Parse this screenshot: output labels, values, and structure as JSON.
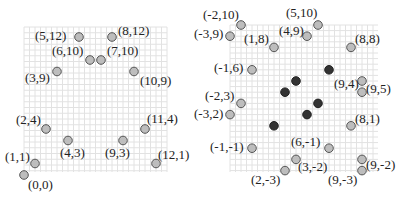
{
  "chart_data": [
    {
      "type": "scatter",
      "title": "",
      "grid": true,
      "xlim": [
        0,
        12
      ],
      "ylim": [
        0,
        12
      ],
      "series": [
        {
          "name": "labeled-points",
          "style": "light",
          "points": [
            {
              "x": 5,
              "y": 12,
              "label": "(5,12)",
              "lx": -44,
              "ly": 3
            },
            {
              "x": 8,
              "y": 12,
              "label": "(8,12)",
              "lx": 6,
              "ly": -2
            },
            {
              "x": 6,
              "y": 10,
              "label": "(6,10)",
              "lx": -38,
              "ly": -5
            },
            {
              "x": 7,
              "y": 10,
              "label": "(7,10)",
              "lx": 6,
              "ly": -5
            },
            {
              "x": 3,
              "y": 9,
              "label": "(3,9)",
              "lx": -32,
              "ly": 10
            },
            {
              "x": 10,
              "y": 9,
              "label": "(10,9)",
              "lx": 6,
              "ly": 13
            },
            {
              "x": 2,
              "y": 4,
              "label": "(2,4)",
              "lx": -30,
              "ly": -5
            },
            {
              "x": 11,
              "y": 4,
              "label": "(11,4)",
              "lx": 2,
              "ly": -6
            },
            {
              "x": 4,
              "y": 3,
              "label": "(4,3)",
              "lx": -8,
              "ly": 16
            },
            {
              "x": 9,
              "y": 3,
              "label": "(9,3)",
              "lx": -18,
              "ly": 16
            },
            {
              "x": 1,
              "y": 1,
              "label": "(1,1)",
              "lx": -30,
              "ly": -3
            },
            {
              "x": 12,
              "y": 1,
              "label": "(12,1)",
              "lx": 2,
              "ly": -5
            },
            {
              "x": 0,
              "y": 0,
              "label": "(0,0)",
              "lx": 4,
              "ly": 14
            }
          ]
        }
      ]
    },
    {
      "type": "scatter",
      "title": "",
      "grid": true,
      "xlim": [
        -3,
        10
      ],
      "ylim": [
        -3,
        10
      ],
      "series": [
        {
          "name": "labeled-points",
          "style": "light",
          "points": [
            {
              "x": -2,
              "y": 10,
              "label": "(-2,10)",
              "lx": -38,
              "ly": -6
            },
            {
              "x": -3,
              "y": 9,
              "label": "(-3,9)",
              "lx": -36,
              "ly": 2
            },
            {
              "x": 1,
              "y": 8,
              "label": "(1,8)",
              "lx": -30,
              "ly": -4
            },
            {
              "x": 4,
              "y": 9,
              "label": "(4,9)",
              "lx": -28,
              "ly": -1
            },
            {
              "x": 5,
              "y": 10,
              "label": "(5,10)",
              "lx": -32,
              "ly": -8
            },
            {
              "x": 8,
              "y": 8,
              "label": "(8,8)",
              "lx": 4,
              "ly": -4
            },
            {
              "x": -1,
              "y": 6,
              "label": "(-1,6)",
              "lx": -38,
              "ly": 2
            },
            {
              "x": 9,
              "y": 5,
              "label": "(9,5)",
              "lx": 4,
              "ly": 12
            },
            {
              "x": 9,
              "y": 4,
              "label": "(9,4)",
              "lx": -28,
              "ly": -4
            },
            {
              "x": -2,
              "y": 3,
              "label": "(-2,3)",
              "lx": -36,
              "ly": -3
            },
            {
              "x": -3,
              "y": 2,
              "label": "(-3,2)",
              "lx": -36,
              "ly": 3
            },
            {
              "x": 8,
              "y": 1,
              "label": "(8,1)",
              "lx": 4,
              "ly": -3
            },
            {
              "x": -1,
              "y": -1,
              "label": "(-1,-1)",
              "lx": -42,
              "ly": 3
            },
            {
              "x": 6,
              "y": -1,
              "label": "(6,-1)",
              "lx": -38,
              "ly": -2
            },
            {
              "x": 3,
              "y": -2,
              "label": "(3,-2)",
              "lx": 2,
              "ly": 12
            },
            {
              "x": 2,
              "y": -3,
              "label": "(2,-3)",
              "lx": -34,
              "ly": 13
            },
            {
              "x": 9,
              "y": -3,
              "label": "(9,-3)",
              "lx": -34,
              "ly": 13
            },
            {
              "x": 9,
              "y": -2,
              "label": "(9,-2)",
              "lx": 4,
              "ly": 10
            }
          ]
        },
        {
          "name": "unlabeled-points",
          "style": "dark",
          "points": [
            {
              "x": 6,
              "y": 6
            },
            {
              "x": 3,
              "y": 5
            },
            {
              "x": 2,
              "y": 4
            },
            {
              "x": 5,
              "y": 3
            },
            {
              "x": 4,
              "y": 2
            },
            {
              "x": 1,
              "y": 1
            }
          ]
        }
      ]
    }
  ],
  "layout": {
    "left": {
      "x0": 24,
      "y0": 175,
      "unit_x": 11.0,
      "unit_y": 11.5,
      "grid_x": [
        24,
        167
      ],
      "grid_y": [
        27,
        172
      ]
    },
    "right": {
      "x0": 263,
      "y0": 137,
      "unit_x": 11.0,
      "unit_y": 11.2,
      "grid_x": [
        230,
        378
      ],
      "grid_y": [
        25,
        172
      ]
    }
  },
  "colors": {
    "grid": "#e2e2e2",
    "light_point": "#bdbdbd",
    "dark_point": "#333333",
    "outline": "#555555",
    "text": "#222222"
  }
}
